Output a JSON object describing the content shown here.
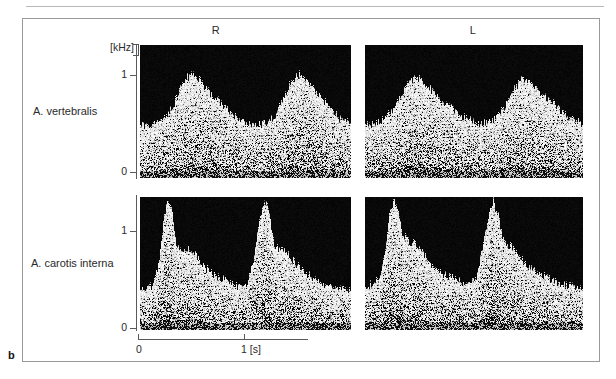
{
  "figure": {
    "part_letter": "b",
    "column_headers": [
      {
        "key": "right",
        "label": "R"
      },
      {
        "key": "left",
        "label": "L"
      }
    ],
    "row_labels": [
      {
        "key": "vertebralis",
        "label": "A. vertebralis"
      },
      {
        "key": "carotis_interna",
        "label": "A. carotis interna"
      }
    ],
    "y_axis": {
      "unit_label": "[kHz]",
      "ticks": [
        {
          "value": 1,
          "label": "1"
        },
        {
          "value": 0,
          "label": "0"
        }
      ]
    },
    "x_axis": {
      "ticks": [
        {
          "value": 0,
          "label": "0"
        },
        {
          "value": 1,
          "label": "1 [s]"
        }
      ],
      "unit": "[s]"
    },
    "colors": {
      "panel_background": "#050505",
      "signal": "#ffffff",
      "axis": "#5a5a5a",
      "frame": "#9a9a9a",
      "text": "#2a2a2a"
    }
  },
  "chart_data": {
    "type": "heatmap",
    "title": "",
    "subtitle": "",
    "xlabel": "1 [s]",
    "ylabel": "[kHz]",
    "xlim": [
      0,
      2.0
    ],
    "ylim": [
      0,
      1.35
    ],
    "grid": false,
    "legend_position": "none",
    "panels": [
      {
        "id": "vertebralis-right",
        "row": "A. vertebralis",
        "column": "R",
        "cycles": 2,
        "cycle_period_s": 0.95,
        "peak_systolic_khz": 1.05,
        "end_diastolic_khz": 0.42,
        "baseline_khz": 0.0,
        "envelope_x": [
          0.0,
          0.08,
          0.16,
          0.24,
          0.32,
          0.4,
          0.48,
          0.56,
          0.64,
          0.72,
          0.8,
          0.88,
          0.96,
          1.04,
          1.12,
          1.2,
          1.28,
          1.36,
          1.44,
          1.52,
          1.6,
          1.68,
          1.76,
          1.84,
          1.92,
          2.0
        ],
        "envelope_y": [
          0.54,
          0.52,
          0.56,
          0.6,
          0.74,
          0.95,
          1.05,
          1.0,
          0.88,
          0.8,
          0.72,
          0.64,
          0.58,
          0.54,
          0.52,
          0.56,
          0.62,
          0.78,
          0.98,
          1.05,
          0.96,
          0.86,
          0.76,
          0.66,
          0.58,
          0.54
        ]
      },
      {
        "id": "vertebralis-left",
        "row": "A. vertebralis",
        "column": "L",
        "cycles": 2,
        "cycle_period_s": 0.95,
        "peak_systolic_khz": 1.02,
        "end_diastolic_khz": 0.44,
        "baseline_khz": 0.0,
        "envelope_x": [
          0.0,
          0.08,
          0.16,
          0.24,
          0.32,
          0.4,
          0.48,
          0.56,
          0.64,
          0.72,
          0.8,
          0.88,
          0.96,
          1.04,
          1.12,
          1.2,
          1.28,
          1.36,
          1.44,
          1.52,
          1.6,
          1.68,
          1.76,
          1.84,
          1.92,
          2.0
        ],
        "envelope_y": [
          0.52,
          0.54,
          0.58,
          0.66,
          0.82,
          0.96,
          1.02,
          0.94,
          0.84,
          0.76,
          0.7,
          0.62,
          0.58,
          0.54,
          0.56,
          0.6,
          0.7,
          0.88,
          1.0,
          0.97,
          0.88,
          0.8,
          0.72,
          0.64,
          0.58,
          0.54
        ]
      },
      {
        "id": "carotis-interna-right",
        "row": "A. carotis interna",
        "column": "R",
        "cycles": 2,
        "cycle_period_s": 0.95,
        "peak_systolic_khz": 1.3,
        "end_diastolic_khz": 0.4,
        "baseline_khz": 0.0,
        "envelope_x": [
          0.0,
          0.06,
          0.12,
          0.18,
          0.22,
          0.26,
          0.3,
          0.34,
          0.4,
          0.46,
          0.52,
          0.58,
          0.64,
          0.72,
          0.8,
          0.88,
          0.96,
          1.02,
          1.08,
          1.14,
          1.18,
          1.22,
          1.26,
          1.3,
          1.36,
          1.42,
          1.48,
          1.56,
          1.64,
          1.72,
          1.8,
          1.9,
          2.0
        ],
        "envelope_y": [
          0.4,
          0.42,
          0.44,
          0.7,
          1.1,
          1.3,
          1.22,
          0.88,
          0.8,
          0.82,
          0.78,
          0.68,
          0.6,
          0.54,
          0.5,
          0.46,
          0.42,
          0.46,
          0.72,
          1.12,
          1.3,
          1.24,
          0.92,
          0.82,
          0.8,
          0.74,
          0.66,
          0.58,
          0.52,
          0.48,
          0.44,
          0.42,
          0.4
        ]
      },
      {
        "id": "carotis-interna-left",
        "row": "A. carotis interna",
        "column": "L",
        "cycles": 2,
        "cycle_period_s": 0.95,
        "peak_systolic_khz": 1.32,
        "end_diastolic_khz": 0.42,
        "baseline_khz": 0.0,
        "envelope_x": [
          0.0,
          0.06,
          0.12,
          0.18,
          0.22,
          0.26,
          0.3,
          0.34,
          0.4,
          0.46,
          0.52,
          0.58,
          0.64,
          0.72,
          0.8,
          0.88,
          0.96,
          1.02,
          1.08,
          1.14,
          1.18,
          1.22,
          1.26,
          1.3,
          1.36,
          1.42,
          1.48,
          1.56,
          1.64,
          1.72,
          1.8,
          1.9,
          2.0
        ],
        "envelope_y": [
          0.44,
          0.46,
          0.5,
          0.78,
          1.16,
          1.32,
          1.2,
          0.96,
          0.9,
          0.86,
          0.8,
          0.7,
          0.62,
          0.56,
          0.52,
          0.48,
          0.46,
          0.52,
          0.82,
          1.18,
          1.3,
          1.18,
          0.94,
          0.88,
          0.82,
          0.74,
          0.66,
          0.6,
          0.54,
          0.5,
          0.46,
          0.44,
          0.42
        ]
      }
    ]
  }
}
